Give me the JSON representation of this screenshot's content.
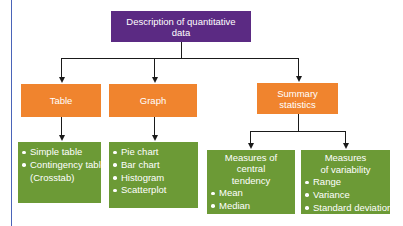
{
  "diagram": {
    "root": {
      "label_line1": "Description of quantitative",
      "label_line2": "data",
      "color": "#5b2a83"
    },
    "branches": [
      {
        "label": "Table",
        "color": "#f0842e",
        "items": [
          "Simple table",
          "Contingency table",
          "(Crosstab)"
        ]
      },
      {
        "label": "Graph",
        "color": "#f0842e",
        "items": [
          "Pie chart",
          "Bar chart",
          "Histogram",
          "Scatterplot"
        ]
      },
      {
        "label_line1": "Summary",
        "label_line2": "statistics",
        "color": "#f0842e",
        "children": [
          {
            "header_line1": "Measures of central",
            "header_line2": "tendency",
            "items": [
              "Mean",
              "Median",
              "Mode"
            ]
          },
          {
            "header_line1": "Measures",
            "header_line2": "of variability",
            "items": [
              "Range",
              "Variance",
              "Standard deviation"
            ]
          }
        ]
      }
    ],
    "colors": {
      "leaf_green": "#6c9a36",
      "connector": "#1a1a1a",
      "left_rule": "#4a64b8"
    }
  }
}
